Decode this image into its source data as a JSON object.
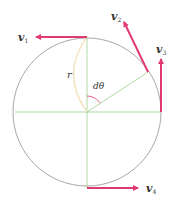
{
  "diagram": {
    "type": "circular-motion-velocity-vectors",
    "colors": {
      "circle": "#a8a8a8",
      "radius_lines": "#9ccf8f",
      "vector": "#e23a6e",
      "arc_r": "#f1ddb0",
      "angle_arc": "#e23a6e",
      "text": "#333333"
    },
    "labels": {
      "v1": {
        "main": "v",
        "sub": "1"
      },
      "v2": {
        "main": "v",
        "sub": "2"
      },
      "v3": {
        "main": "v",
        "sub": "3"
      },
      "v4": {
        "main": "v",
        "sub": "4"
      },
      "radius": "r",
      "angle": "dθ"
    }
  }
}
